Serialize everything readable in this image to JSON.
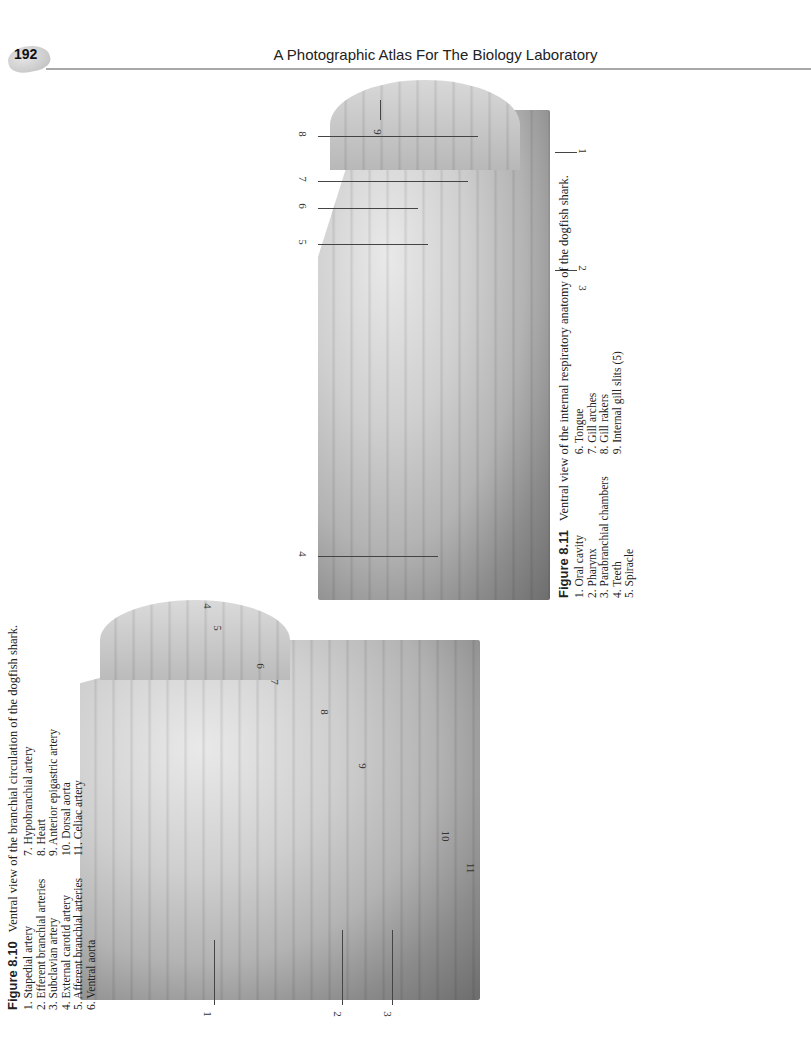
{
  "header": {
    "page_number": "192",
    "running_title": "A Photographic Atlas For The Biology Laboratory"
  },
  "figure_8_11": {
    "label": "Figure 8.11",
    "title": "Ventral view of the internal respiratory anatomy of the dogfish shark.",
    "items_col1": [
      "1. Oral cavity",
      "2. Pharynx",
      "3. Parabranchial chambers",
      "4. Teeth",
      "5. Spiracle"
    ],
    "items_col2": [
      "6. Tongue",
      "7. Gill arches",
      "8. Gill rakers",
      "9. Internal gill slits (5)"
    ],
    "callouts": [
      "1",
      "2",
      "3",
      "4",
      "5",
      "6",
      "7",
      "8",
      "9"
    ]
  },
  "figure_8_10": {
    "label": "Figure 8.10",
    "title": "Ventral view of the branchial circulation of the dogfish shark.",
    "items_col1": [
      "1. Stapedial artery",
      "2. Efferent branchial arteries",
      "3. Subclavian artery",
      "4. External carotid artery",
      "5. Afferent branchial arteries",
      "6. Ventral aorta"
    ],
    "items_col2": [
      "7. Hypobranchial artery",
      "8. Heart",
      "9. Anterior epigastric artery",
      "10. Dorsal aorta",
      "11. Celiac artery"
    ],
    "callouts": [
      "1",
      "2",
      "3",
      "4",
      "5",
      "6",
      "7",
      "8",
      "9",
      "10",
      "11"
    ]
  }
}
